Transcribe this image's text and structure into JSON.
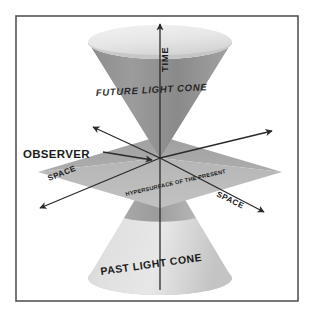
{
  "figure": {
    "border_color": "#555555",
    "background_color": "#ffffff"
  },
  "labels": {
    "time_axis": "TIME",
    "future_cone": "FUTURE LIGHT CONE",
    "past_cone": "PAST LIGHT CONE",
    "observer": "OBSERVER",
    "hypersurface": "HYPERSURFACE OF THE PRESENT",
    "space_left": "SPACE",
    "space_right": "SPACE"
  },
  "colors": {
    "cone_body": "#909090",
    "cone_top_disc": "#e9e9e9",
    "past_cone_body": "#d8d8d8",
    "past_cone_shadow": "#9a9a9a",
    "plane": "#a8a8a8",
    "plane_front": "#bdbdbd",
    "axis_line": "#2a2a2a",
    "label_text": "#1b1b1b"
  },
  "geometry": {
    "apex_x": 160,
    "apex_y": 158,
    "future_cone_rim_y": 42,
    "past_cone_rim_y": 278,
    "cone_rim_half_width": 72,
    "border_inset": 15
  }
}
